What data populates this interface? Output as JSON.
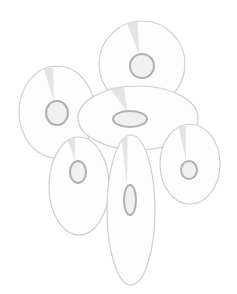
{
  "image": {
    "description": "Illustration of six scattered CD/DVD discs in light gray line art",
    "colors": {
      "background": "#ffffff",
      "outline": "#cfcfcf",
      "hub": "#b0b0b0",
      "fill": "#fdfdfd",
      "shine": "#d8d8d8"
    },
    "discs": [
      {
        "id": "top",
        "cx": 142,
        "cy": 64,
        "rx": 43,
        "ry": 43,
        "rot": 0,
        "hx": 142,
        "hy": 66,
        "hrx": 12,
        "hry": 12
      },
      {
        "id": "left",
        "cx": 57,
        "cy": 112,
        "rx": 38,
        "ry": 46,
        "rot": 0,
        "hx": 57,
        "hy": 113,
        "hrx": 11,
        "hry": 12
      },
      {
        "id": "middle",
        "cx": 138,
        "cy": 118,
        "rx": 60,
        "ry": 32,
        "rot": 0,
        "hx": 130,
        "hy": 119,
        "hrx": 17,
        "hry": 8
      },
      {
        "id": "lower-left",
        "cx": 79,
        "cy": 186,
        "rx": 30,
        "ry": 49,
        "rot": 0,
        "hx": 78,
        "hy": 172,
        "hrx": 8,
        "hry": 11
      },
      {
        "id": "bottom",
        "cx": 131,
        "cy": 210,
        "rx": 24,
        "ry": 75,
        "rot": 0,
        "hx": 130,
        "hy": 200,
        "hrx": 6,
        "hry": 15
      },
      {
        "id": "right",
        "cx": 190,
        "cy": 164,
        "rx": 30,
        "ry": 40,
        "rot": 0,
        "hx": 189,
        "hy": 170,
        "hrx": 8,
        "hry": 9
      }
    ]
  }
}
